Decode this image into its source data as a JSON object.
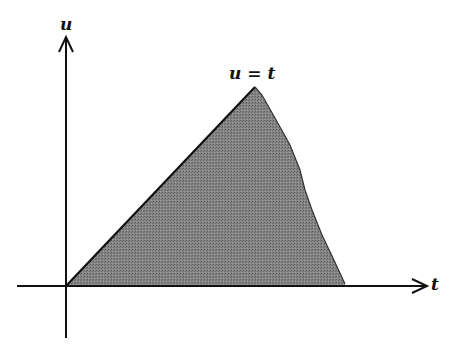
{
  "diagram": {
    "axes": {
      "vertical_label": "u",
      "horizontal_label": "t"
    },
    "line_label": "u = t",
    "region": {
      "description": "shaded triangular region under line u=t",
      "fill_color": "#7a7a7a",
      "edge_color": "#111111"
    }
  }
}
